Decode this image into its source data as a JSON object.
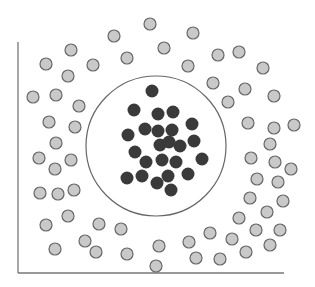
{
  "diagram": {
    "colors": {
      "background": "#ffffff",
      "axis": "#777777",
      "boundary": "#666666",
      "inner_fill": "#3a3a3a",
      "outer_fill": "#c9c9c9",
      "outer_stroke": "#666666"
    },
    "axes": {
      "y_axis": {
        "x": 18,
        "y1": 42,
        "y2": 273
      },
      "x_axis": {
        "y": 273,
        "x1": 18,
        "x2": 284
      }
    },
    "boundary_circle": {
      "cx": 156,
      "cy": 146,
      "r": 70
    },
    "point_radius": 6,
    "inner_points": [
      [
        152,
        91
      ],
      [
        134,
        110
      ],
      [
        158,
        114
      ],
      [
        173,
        112
      ],
      [
        192,
        124
      ],
      [
        128,
        135
      ],
      [
        145,
        129
      ],
      [
        158,
        131
      ],
      [
        172,
        130
      ],
      [
        160,
        145
      ],
      [
        169,
        142
      ],
      [
        180,
        146
      ],
      [
        194,
        141
      ],
      [
        135,
        152
      ],
      [
        146,
        162
      ],
      [
        162,
        160
      ],
      [
        176,
        162
      ],
      [
        202,
        159
      ],
      [
        127,
        178
      ],
      [
        142,
        176
      ],
      [
        168,
        176
      ],
      [
        188,
        174
      ],
      [
        157,
        183
      ],
      [
        171,
        190
      ]
    ],
    "outer_points": [
      [
        150,
        24
      ],
      [
        114,
        36
      ],
      [
        193,
        33
      ],
      [
        71,
        50
      ],
      [
        164,
        48
      ],
      [
        46,
        64
      ],
      [
        93,
        65
      ],
      [
        127,
        58
      ],
      [
        68,
        76
      ],
      [
        188,
        66
      ],
      [
        218,
        55
      ],
      [
        239,
        52
      ],
      [
        263,
        68
      ],
      [
        213,
        83
      ],
      [
        245,
        89
      ],
      [
        274,
        96
      ],
      [
        228,
        102
      ],
      [
        33,
        97
      ],
      [
        56,
        95
      ],
      [
        79,
        106
      ],
      [
        49,
        122
      ],
      [
        75,
        127
      ],
      [
        56,
        143
      ],
      [
        39,
        158
      ],
      [
        71,
        160
      ],
      [
        55,
        169
      ],
      [
        40,
        193
      ],
      [
        58,
        194
      ],
      [
        74,
        190
      ],
      [
        248,
        123
      ],
      [
        274,
        128
      ],
      [
        294,
        125
      ],
      [
        270,
        144
      ],
      [
        251,
        158
      ],
      [
        275,
        162
      ],
      [
        291,
        169
      ],
      [
        257,
        179
      ],
      [
        278,
        182
      ],
      [
        250,
        198
      ],
      [
        283,
        201
      ],
      [
        267,
        212
      ],
      [
        239,
        218
      ],
      [
        210,
        233
      ],
      [
        256,
        230
      ],
      [
        280,
        230
      ],
      [
        232,
        239
      ],
      [
        189,
        242
      ],
      [
        270,
        245
      ],
      [
        246,
        252
      ],
      [
        196,
        258
      ],
      [
        220,
        259
      ],
      [
        121,
        229
      ],
      [
        159,
        246
      ],
      [
        127,
        254
      ],
      [
        156,
        266
      ],
      [
        68,
        216
      ],
      [
        46,
        225
      ],
      [
        99,
        224
      ],
      [
        55,
        249
      ],
      [
        85,
        241
      ],
      [
        96,
        252
      ]
    ]
  }
}
